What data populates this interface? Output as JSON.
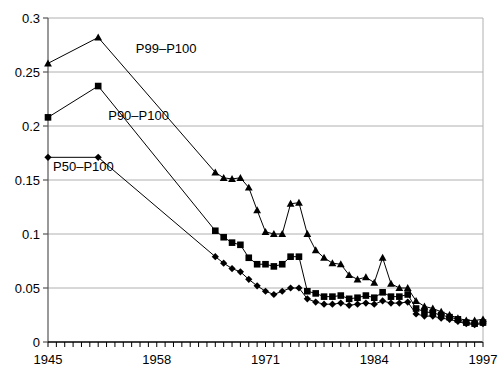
{
  "chart_data": {
    "type": "line",
    "title": "",
    "subtitle": "",
    "xlabel": "",
    "ylabel": "",
    "xlim": [
      1945,
      1997
    ],
    "ylim": [
      0,
      0.3
    ],
    "grid": true,
    "legend_position": "inline-annotations",
    "x_tick_labels": [
      "1945",
      "1958",
      "1971",
      "1984",
      "1997"
    ],
    "x_tick_values": [
      1945,
      1958,
      1971,
      1984,
      1997
    ],
    "x_minor_tick_step": 1,
    "y_tick_labels": [
      "0",
      "0.05",
      "0.1",
      "0.15",
      "0.2",
      "0.25",
      "0.3"
    ],
    "y_tick_values": [
      0,
      0.05,
      0.1,
      0.15,
      0.2,
      0.25,
      0.3
    ],
    "series": [
      {
        "name": "P99-P100",
        "label": "P99–P100",
        "marker": "triangle",
        "color": "#000000",
        "label_x": 1955.5,
        "label_y": 0.268,
        "x": [
          1945,
          1951,
          1965,
          1966,
          1967,
          1968,
          1969,
          1970,
          1971,
          1972,
          1973,
          1974,
          1975,
          1976,
          1977,
          1978,
          1979,
          1980,
          1981,
          1982,
          1983,
          1984,
          1985,
          1986,
          1987,
          1988,
          1989,
          1990,
          1991,
          1992,
          1993,
          1994,
          1995,
          1996,
          1997
        ],
        "y": [
          0.258,
          0.282,
          0.157,
          0.152,
          0.151,
          0.152,
          0.143,
          0.122,
          0.102,
          0.1,
          0.1,
          0.128,
          0.129,
          0.1,
          0.085,
          0.078,
          0.073,
          0.072,
          0.062,
          0.058,
          0.06,
          0.055,
          0.078,
          0.054,
          0.05,
          0.05,
          0.038,
          0.033,
          0.031,
          0.028,
          0.025,
          0.022,
          0.02,
          0.02,
          0.021
        ]
      },
      {
        "name": "P90-P100",
        "label": "P90–P100",
        "marker": "square",
        "color": "#000000",
        "label_x": 1952.2,
        "label_y": 0.206,
        "x": [
          1945,
          1951,
          1965,
          1966,
          1967,
          1968,
          1969,
          1970,
          1971,
          1972,
          1973,
          1974,
          1975,
          1976,
          1977,
          1978,
          1979,
          1980,
          1981,
          1982,
          1983,
          1984,
          1985,
          1986,
          1987,
          1988,
          1989,
          1990,
          1991,
          1992,
          1993,
          1994,
          1995,
          1996,
          1997
        ],
        "y": [
          0.208,
          0.237,
          0.103,
          0.097,
          0.092,
          0.09,
          0.078,
          0.072,
          0.072,
          0.07,
          0.072,
          0.079,
          0.079,
          0.047,
          0.045,
          0.042,
          0.042,
          0.043,
          0.04,
          0.041,
          0.043,
          0.041,
          0.046,
          0.042,
          0.042,
          0.044,
          0.031,
          0.028,
          0.027,
          0.025,
          0.023,
          0.021,
          0.018,
          0.017,
          0.018
        ]
      },
      {
        "name": "P50-P100",
        "label": "P50–P100",
        "marker": "diamond",
        "color": "#000000",
        "label_x": 1945.6,
        "label_y": 0.158,
        "x": [
          1945,
          1951,
          1965,
          1966,
          1967,
          1968,
          1969,
          1970,
          1971,
          1972,
          1973,
          1974,
          1975,
          1976,
          1977,
          1978,
          1979,
          1980,
          1981,
          1982,
          1983,
          1984,
          1985,
          1986,
          1987,
          1988,
          1989,
          1990,
          1991,
          1992,
          1993,
          1994,
          1995,
          1996,
          1997
        ],
        "y": [
          0.171,
          0.171,
          0.079,
          0.073,
          0.068,
          0.065,
          0.058,
          0.052,
          0.047,
          0.044,
          0.047,
          0.05,
          0.05,
          0.04,
          0.037,
          0.035,
          0.035,
          0.036,
          0.034,
          0.035,
          0.036,
          0.035,
          0.038,
          0.036,
          0.036,
          0.037,
          0.026,
          0.024,
          0.024,
          0.022,
          0.021,
          0.019,
          0.017,
          0.016,
          0.017
        ]
      }
    ]
  }
}
